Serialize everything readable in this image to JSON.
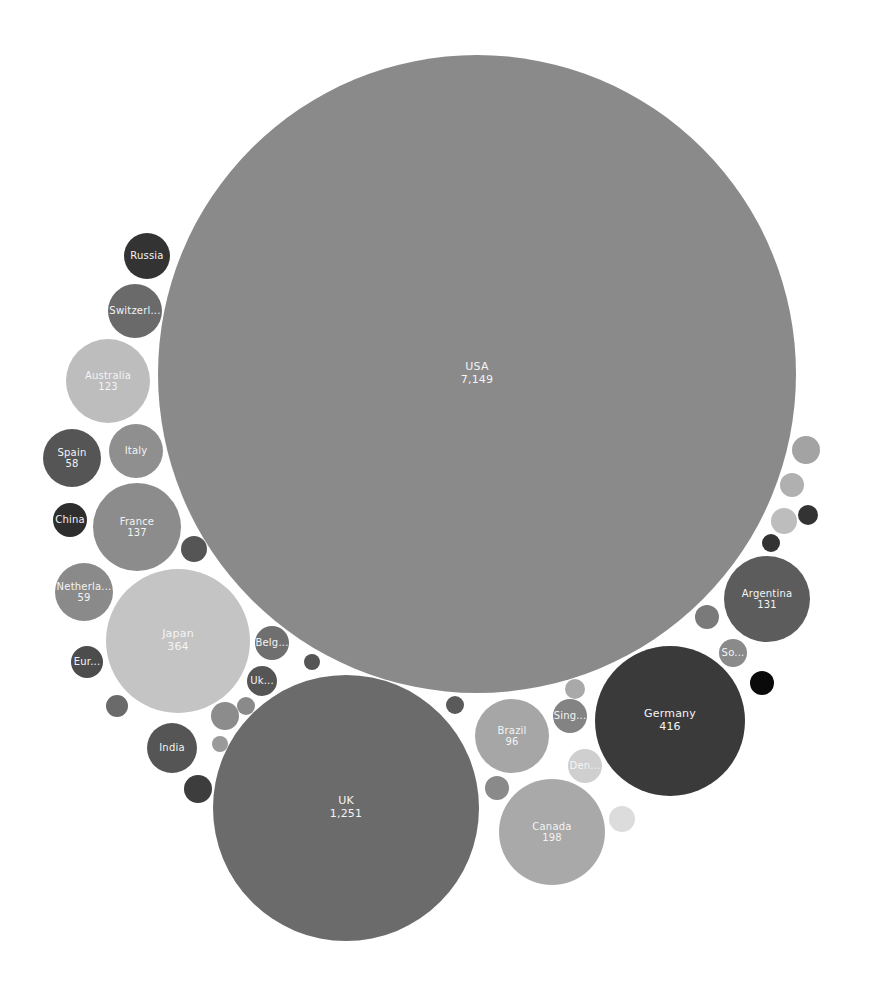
{
  "chart_data": {
    "type": "bubble",
    "title": "",
    "xlabel": "",
    "ylabel": "",
    "legend": "none",
    "grid": false,
    "bubbles": [
      {
        "id": "usa",
        "label": "USA",
        "value": "7,149",
        "cx": 477,
        "cy": 374,
        "r": 319,
        "color": "#8a8a8a"
      },
      {
        "id": "uk",
        "label": "UK",
        "value": "1,251",
        "cx": 346,
        "cy": 808,
        "r": 133,
        "color": "#6b6b6b"
      },
      {
        "id": "germany",
        "label": "Germany",
        "value": "416",
        "cx": 670,
        "cy": 721,
        "r": 75,
        "color": "#3a3a3a"
      },
      {
        "id": "japan",
        "label": "Japan",
        "value": "364",
        "cx": 178,
        "cy": 641,
        "r": 72,
        "color": "#c4c4c4"
      },
      {
        "id": "canada",
        "label": "Canada",
        "value": "198",
        "cx": 552,
        "cy": 832,
        "r": 53,
        "color": "#a9a9a9"
      },
      {
        "id": "france",
        "label": "France",
        "value": "137",
        "cx": 137,
        "cy": 527,
        "r": 44,
        "color": "#8c8c8c"
      },
      {
        "id": "argentina",
        "label": "Argentina",
        "value": "131",
        "cx": 767,
        "cy": 599,
        "r": 43,
        "color": "#5c5c5c"
      },
      {
        "id": "australia",
        "label": "Australia",
        "value": "123",
        "cx": 108,
        "cy": 381,
        "r": 42,
        "color": "#bdbdbd"
      },
      {
        "id": "brazil",
        "label": "Brazil",
        "value": "96",
        "cx": 512,
        "cy": 736,
        "r": 37,
        "color": "#a6a6a6"
      },
      {
        "id": "netherlands",
        "label": "Netherla...",
        "value": "59",
        "cx": 84,
        "cy": 592,
        "r": 29,
        "color": "#8a8a8a"
      },
      {
        "id": "spain",
        "label": "Spain",
        "value": "58",
        "cx": 72,
        "cy": 458,
        "r": 29,
        "color": "#555555"
      },
      {
        "id": "italy",
        "label": "Italy",
        "value": "",
        "cx": 136,
        "cy": 451,
        "r": 27,
        "color": "#8f8f8f"
      },
      {
        "id": "switzerland",
        "label": "Switzerl...",
        "value": "",
        "cx": 135,
        "cy": 311,
        "r": 27,
        "color": "#6a6a6a"
      },
      {
        "id": "india",
        "label": "India",
        "value": "",
        "cx": 172,
        "cy": 748,
        "r": 25,
        "color": "#555555"
      },
      {
        "id": "russia",
        "label": "Russia",
        "value": "",
        "cx": 147,
        "cy": 256,
        "r": 23,
        "color": "#333333"
      },
      {
        "id": "belgium",
        "label": "Belg...",
        "value": "",
        "cx": 272,
        "cy": 643,
        "r": 17,
        "color": "#6f6f6f"
      },
      {
        "id": "singapore",
        "label": "Sing...",
        "value": "",
        "cx": 570,
        "cy": 716,
        "r": 17,
        "color": "#838383"
      },
      {
        "id": "denmark",
        "label": "Den...",
        "value": "",
        "cx": 585,
        "cy": 766,
        "r": 17,
        "color": "#cfcfcf"
      },
      {
        "id": "china",
        "label": "China",
        "value": "",
        "cx": 70,
        "cy": 520,
        "r": 17,
        "color": "#2e2e2e"
      },
      {
        "id": "europe",
        "label": "Eur...",
        "value": "",
        "cx": 87,
        "cy": 662,
        "r": 16,
        "color": "#4c4c4c"
      },
      {
        "id": "ukraine",
        "label": "Uk...",
        "value": "",
        "cx": 262,
        "cy": 681,
        "r": 15,
        "color": "#555555"
      },
      {
        "id": "south",
        "label": "So...",
        "value": "",
        "cx": 733,
        "cy": 653,
        "r": 14,
        "color": "#8a8a8a"
      },
      {
        "id": "b1",
        "label": "",
        "value": "",
        "cx": 194,
        "cy": 549,
        "r": 13,
        "color": "#555555"
      },
      {
        "id": "b2",
        "label": "",
        "value": "",
        "cx": 117,
        "cy": 706,
        "r": 11,
        "color": "#6a6a6a"
      },
      {
        "id": "b3",
        "label": "",
        "value": "",
        "cx": 198,
        "cy": 789,
        "r": 14,
        "color": "#3d3d3d"
      },
      {
        "id": "b4",
        "label": "",
        "value": "",
        "cx": 225,
        "cy": 716,
        "r": 14,
        "color": "#8c8c8c"
      },
      {
        "id": "b5",
        "label": "",
        "value": "",
        "cx": 246,
        "cy": 706,
        "r": 9,
        "color": "#8a8a8a"
      },
      {
        "id": "b6",
        "label": "",
        "value": "",
        "cx": 220,
        "cy": 744,
        "r": 8,
        "color": "#9a9a9a"
      },
      {
        "id": "b7",
        "label": "",
        "value": "",
        "cx": 312,
        "cy": 662,
        "r": 8,
        "color": "#555555"
      },
      {
        "id": "b8",
        "label": "",
        "value": "",
        "cx": 455,
        "cy": 705,
        "r": 9,
        "color": "#5a5a5a"
      },
      {
        "id": "b9",
        "label": "",
        "value": "",
        "cx": 497,
        "cy": 788,
        "r": 12,
        "color": "#8a8a8a"
      },
      {
        "id": "b10",
        "label": "",
        "value": "",
        "cx": 575,
        "cy": 689,
        "r": 10,
        "color": "#a9a9a9"
      },
      {
        "id": "b11",
        "label": "",
        "value": "",
        "cx": 622,
        "cy": 819,
        "r": 13,
        "color": "#dcdcdc"
      },
      {
        "id": "b12",
        "label": "",
        "value": "",
        "cx": 707,
        "cy": 617,
        "r": 12,
        "color": "#7a7a7a"
      },
      {
        "id": "b13",
        "label": "",
        "value": "",
        "cx": 762,
        "cy": 683,
        "r": 12,
        "color": "#0a0a0a"
      },
      {
        "id": "b14",
        "label": "",
        "value": "",
        "cx": 806,
        "cy": 450,
        "r": 14,
        "color": "#a3a3a3"
      },
      {
        "id": "b15",
        "label": "",
        "value": "",
        "cx": 792,
        "cy": 485,
        "r": 12,
        "color": "#b0b0b0"
      },
      {
        "id": "b16",
        "label": "",
        "value": "",
        "cx": 784,
        "cy": 521,
        "r": 13,
        "color": "#bdbdbd"
      },
      {
        "id": "b17",
        "label": "",
        "value": "",
        "cx": 808,
        "cy": 515,
        "r": 10,
        "color": "#333333"
      },
      {
        "id": "b18",
        "label": "",
        "value": "",
        "cx": 771,
        "cy": 543,
        "r": 9,
        "color": "#333333"
      }
    ]
  }
}
